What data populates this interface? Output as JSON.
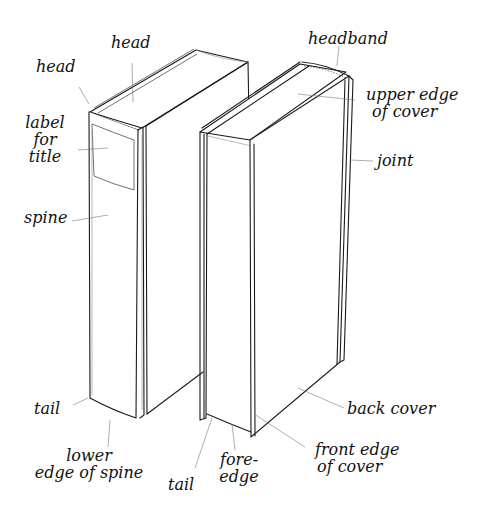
{
  "diagram": {
    "ink_color": "#1a1a1a",
    "background": "#ffffff",
    "labels": {
      "head_spine": "head",
      "head_top": "head",
      "label_for_title": [
        "label",
        "for",
        "title"
      ],
      "spine": "spine",
      "tail_left": "tail",
      "lower_edge_of_spine": [
        "lower",
        "edge of spine"
      ],
      "headband": "headband",
      "upper_edge_of_cover": [
        "upper edge",
        "of cover"
      ],
      "joint": "joint",
      "back_cover": "back cover",
      "front_edge_of_cover": [
        "front edge",
        "of cover"
      ],
      "fore_edge": [
        "fore-",
        "edge"
      ],
      "tail_right": "tail"
    }
  }
}
